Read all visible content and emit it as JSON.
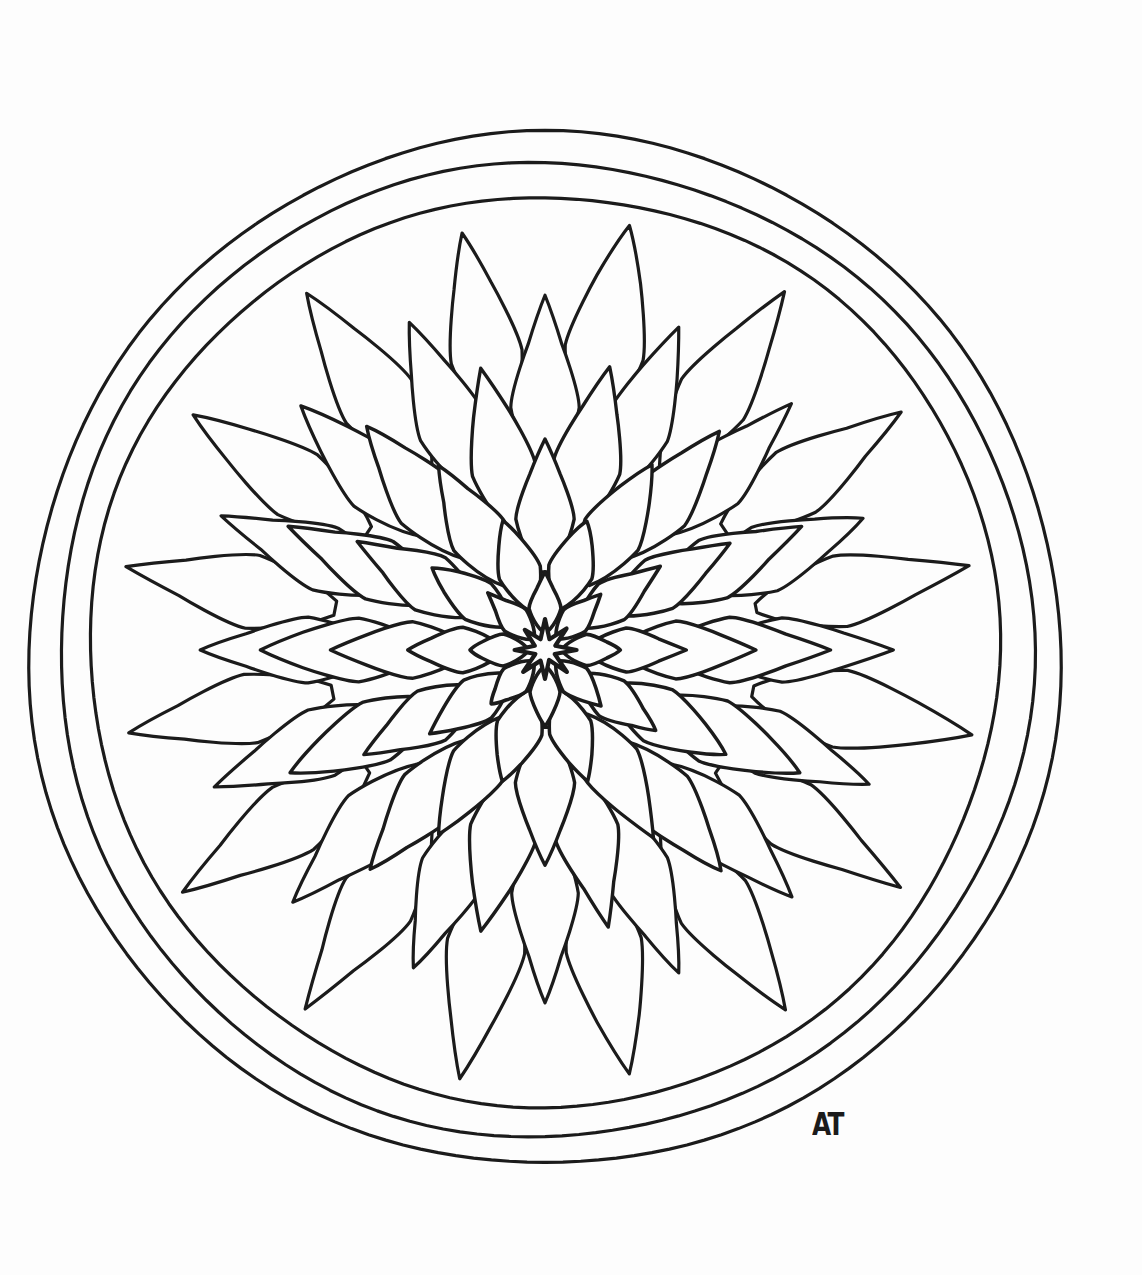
{
  "artwork": {
    "title": "Hand-drawn Flower Mandala",
    "subject": "mandala-flower",
    "medium": "black ink line drawing on white paper",
    "style": "coloring-page",
    "background_color": "#fdfdfd",
    "ink_color": "#1b1b1b",
    "canvas": {
      "width": 1142,
      "height": 1275
    }
  },
  "signature": {
    "text": "AT",
    "position": {
      "x": 812,
      "y": 1106
    }
  },
  "composition": {
    "center": {
      "x": 545,
      "y": 650
    },
    "border_rings": [
      {
        "name": "outer-border-circle",
        "radius": 516,
        "stroke_width": 3.2
      },
      {
        "name": "middle-border-circle",
        "radius": 487,
        "stroke_width": 3.2
      },
      {
        "name": "inner-border-circle",
        "radius": 455,
        "stroke_width": 3.2
      }
    ],
    "petal_rings": [
      {
        "name": "ring-1-outermost",
        "count": 16,
        "inner_radius": 214,
        "outer_radius": 430,
        "width": 0.175,
        "rotation_offset": 11.25,
        "shape": "flame",
        "stroke_width": 3.2
      },
      {
        "name": "ring-2",
        "count": 16,
        "inner_radius": 166,
        "outer_radius": 352,
        "width": 0.182,
        "rotation_offset": 0,
        "shape": "flame",
        "stroke_width": 3.2
      },
      {
        "name": "ring-3",
        "count": 14,
        "inner_radius": 120,
        "outer_radius": 286,
        "width": 0.195,
        "rotation_offset": 12.86,
        "shape": "flame",
        "stroke_width": 3.4
      },
      {
        "name": "ring-4",
        "count": 12,
        "inner_radius": 78,
        "outer_radius": 212,
        "width": 0.215,
        "rotation_offset": 0,
        "shape": "flame",
        "stroke_width": 3.4
      },
      {
        "name": "ring-5",
        "count": 10,
        "inner_radius": 44,
        "outer_radius": 140,
        "width": 0.235,
        "rotation_offset": 18,
        "shape": "flame",
        "stroke_width": 3.5
      },
      {
        "name": "ring-6-innermost",
        "count": 8,
        "inner_radius": 18,
        "outer_radius": 78,
        "width": 0.26,
        "rotation_offset": 0,
        "shape": "flame",
        "stroke_width": 3.6
      }
    ],
    "core": {
      "name": "center-star",
      "points": 8,
      "outer_radius": 30,
      "inner_radius": 11,
      "stroke_width": 4.2
    }
  },
  "labels": {
    "page_title": "Mandala Coloring Page",
    "artboard_name": "mandala-artboard",
    "signature_name": "artist-signature"
  }
}
